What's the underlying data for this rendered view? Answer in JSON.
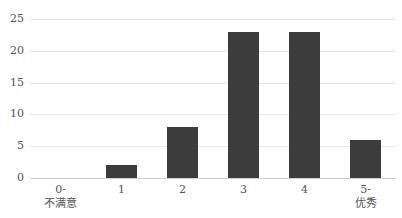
{
  "chart_data": {
    "type": "bar",
    "title": "",
    "xlabel": "",
    "ylabel": "",
    "categories": [
      "0-\n不满意",
      "1",
      "2",
      "3",
      "4",
      "5-\n优秀"
    ],
    "category_lines": [
      [
        "0-",
        "不满意"
      ],
      [
        "1"
      ],
      [
        "2"
      ],
      [
        "3"
      ],
      [
        "4"
      ],
      [
        "5-",
        "优秀"
      ]
    ],
    "values": [
      0,
      2,
      8,
      23,
      23,
      6
    ],
    "ylim": [
      0,
      25
    ],
    "yticks": [
      0,
      5,
      10,
      15,
      20,
      25
    ],
    "grid": true,
    "legend": null,
    "bar_color": "#3c3c3c"
  }
}
